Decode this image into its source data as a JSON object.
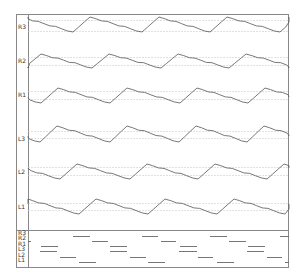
{
  "chart_data": {
    "type": "line",
    "title": "",
    "channels": [
      "R3",
      "R2",
      "R1",
      "L3",
      "L2",
      "L1"
    ],
    "xlim": [
      28,
      289
    ],
    "grid": "two dashed reference lines per channel",
    "series": [
      {
        "name": "R3",
        "label_y": 27,
        "peak_y": 17,
        "trough_y": 32,
        "ref_lines": [
          20,
          31
        ],
        "rise_starts": [
          4,
          73,
          142,
          210,
          280
        ]
      },
      {
        "name": "R2",
        "label_y": 61,
        "peak_y": 54,
        "trough_y": 68,
        "ref_lines": [
          57,
          65
        ],
        "rise_starts": [
          24,
          92,
          161,
          229
        ]
      },
      {
        "name": "R1",
        "label_y": 95,
        "peak_y": 88,
        "trough_y": 103,
        "ref_lines": [
          91,
          99
        ],
        "rise_starts": [
          41,
          110,
          180,
          248
        ]
      },
      {
        "name": "L3",
        "label_y": 139,
        "peak_y": 126,
        "trough_y": 142,
        "ref_lines": [
          131,
          138
        ],
        "rise_starts": [
          40,
          110,
          179,
          247
        ]
      },
      {
        "name": "L2",
        "label_y": 172,
        "peak_y": 164,
        "trough_y": 179,
        "ref_lines": [
          167,
          175
        ],
        "rise_starts": [
          -9,
          60,
          130,
          198,
          267
        ]
      },
      {
        "name": "L1",
        "label_y": 207,
        "peak_y": 199,
        "trough_y": 214,
        "ref_lines": [
          203,
          210
        ],
        "rise_starts": [
          10,
          79,
          148,
          217,
          285
        ]
      }
    ],
    "event_panel": {
      "labels": [
        "R3",
        "R2",
        "R1",
        "L3",
        "L2",
        "L1"
      ],
      "rows": [
        {
          "name": "R3",
          "y": 236,
          "bars": [
            [
              73,
              90
            ],
            [
              142,
              158
            ],
            [
              210,
              227
            ],
            [
              280,
              289
            ]
          ]
        },
        {
          "name": "R2",
          "y": 241,
          "bars": [
            [
              28,
              31
            ],
            [
              92,
              108
            ],
            [
              161,
              176
            ],
            [
              229,
              246
            ]
          ]
        },
        {
          "name": "R1",
          "y": 246,
          "bars": [
            [
              41,
              58
            ],
            [
              110,
              127
            ],
            [
              180,
              197
            ],
            [
              248,
              265
            ]
          ]
        },
        {
          "name": "L3",
          "y": 251,
          "bars": [
            [
              40,
              57
            ],
            [
              110,
              127
            ],
            [
              179,
              197
            ],
            [
              247,
              264
            ]
          ]
        },
        {
          "name": "L2",
          "y": 257,
          "bars": [
            [
              60,
              76
            ],
            [
              130,
              146
            ],
            [
              198,
              213
            ],
            [
              267,
              282
            ]
          ]
        },
        {
          "name": "L1",
          "y": 262,
          "bars": [
            [
              79,
              96
            ],
            [
              148,
              165
            ],
            [
              217,
              234
            ],
            [
              285,
              289
            ]
          ]
        }
      ]
    },
    "period_px": 69,
    "rise_width_px": 17,
    "colors": {
      "trace": "#555555",
      "frame": "#888888",
      "grid": "#cccccc",
      "bar": "#666666",
      "label": "#333333"
    }
  }
}
